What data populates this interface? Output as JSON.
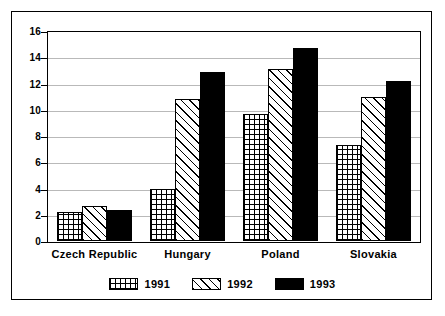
{
  "chart_data": {
    "type": "bar",
    "title": "",
    "subtitle": "",
    "xlabel": "",
    "ylabel": "",
    "categories": [
      "Czech Republic",
      "Hungary",
      "Poland",
      "Slovakia"
    ],
    "series": [
      {
        "name": "1991",
        "pattern": "grid-crosshatch",
        "values": [
          2.2,
          4.0,
          9.7,
          7.3
        ]
      },
      {
        "name": "1992",
        "pattern": "diagonal-hatch",
        "values": [
          2.7,
          10.8,
          13.1,
          11.0
        ]
      },
      {
        "name": "1993",
        "pattern": "solid-black",
        "values": [
          2.4,
          12.9,
          14.7,
          12.2
        ]
      }
    ],
    "ylim": [
      0,
      16
    ],
    "yticks": [
      0,
      2,
      4,
      6,
      8,
      10,
      12,
      14,
      16
    ],
    "ytick_labels": [
      "0",
      "2",
      "4",
      "6",
      "8",
      "10",
      "12",
      "14",
      "16"
    ],
    "grid": true,
    "grid_axis": "y",
    "legend_position": "bottom-center",
    "colors": {
      "axis": "#000000",
      "grid": "#b9b9b9",
      "background": "#ffffff",
      "series_1993": "#000000"
    }
  },
  "legend": {
    "items": [
      {
        "label": "1991"
      },
      {
        "label": "1992"
      },
      {
        "label": "1993"
      }
    ]
  }
}
